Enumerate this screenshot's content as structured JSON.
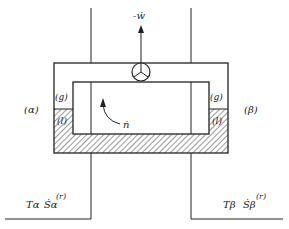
{
  "diagram": {
    "work_label": "-ẇ",
    "left_reservoir_label": "(α)",
    "right_reservoir_label": "(β)",
    "gas_label_left": "(g)",
    "gas_label_right": "(g)",
    "liquid_label_left": "(l)",
    "liquid_label_right": "(l)",
    "flow_label": "ṅ",
    "left_temp": "Tα",
    "left_entropy": "Ṡα",
    "left_entropy_sup": "(r)",
    "right_temp": "Tβ",
    "right_entropy": "Ṡβ",
    "right_entropy_sup": "(r)",
    "colors": {
      "line": "#222222",
      "background": "#ffffff"
    }
  }
}
